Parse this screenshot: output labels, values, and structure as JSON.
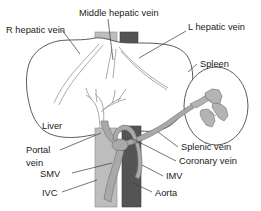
{
  "diagram": {
    "background_color": "#ffffff",
    "labels": {
      "r_hepatic_vein": "R hepatic vein",
      "middle_hepatic_vein": "Middle hepatic vein",
      "l_hepatic_vein": "L hepatic vein",
      "spleen": "Spleen",
      "liver": "Liver",
      "portal_vein_line1": "Portal",
      "portal_vein_line2": "vein",
      "smv": "SMV",
      "ivc": "IVC",
      "splenic_vein": "Splenic vein",
      "coronary_vein": "Coronary vein",
      "imv": "IMV",
      "aorta": "Aorta"
    },
    "colors": {
      "ivc": "#bdbdbd",
      "aorta": "#545454",
      "portal_system": "#a9a9a9",
      "outline": "#4a4a4a",
      "thin_vein": "#9a9a9a",
      "label_text": "#1a1a1a",
      "leader_line": "#3a3a3a"
    }
  }
}
